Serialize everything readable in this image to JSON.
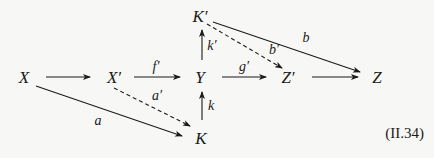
{
  "diagram": {
    "type": "commutative-diagram",
    "equation_number": "(II.34)",
    "nodes": [
      {
        "id": "X",
        "label": "X",
        "x": 24,
        "y": 77
      },
      {
        "id": "Xp",
        "label": "X′",
        "x": 113,
        "y": 77
      },
      {
        "id": "Y",
        "label": "Y",
        "x": 200,
        "y": 77
      },
      {
        "id": "Zp",
        "label": "Z′",
        "x": 286,
        "y": 77
      },
      {
        "id": "Z",
        "label": "Z",
        "x": 376,
        "y": 77
      },
      {
        "id": "Kp",
        "label": "K′",
        "x": 198,
        "y": 16
      },
      {
        "id": "K",
        "label": "K",
        "x": 200,
        "y": 137
      }
    ],
    "edges": [
      {
        "from": "X",
        "to": "Xp",
        "label": "",
        "style": "solid"
      },
      {
        "from": "Xp",
        "to": "Y",
        "label": "f′",
        "style": "solid"
      },
      {
        "from": "Y",
        "to": "Zp",
        "label": "g′",
        "style": "solid"
      },
      {
        "from": "Zp",
        "to": "Z",
        "label": "",
        "style": "solid"
      },
      {
        "from": "Y",
        "to": "Kp",
        "label": "k′",
        "style": "solid"
      },
      {
        "from": "K",
        "to": "Y",
        "label": "k",
        "style": "solid"
      },
      {
        "from": "Kp",
        "to": "Z",
        "label": "b",
        "style": "solid"
      },
      {
        "from": "Kp",
        "to": "Zp",
        "label": "b′",
        "style": "dashed"
      },
      {
        "from": "X",
        "to": "K",
        "label": "a",
        "style": "solid"
      },
      {
        "from": "Xp",
        "to": "K",
        "label": "a′",
        "style": "dashed"
      }
    ],
    "labels": {
      "X": "X",
      "Xp": "X′",
      "Y": "Y",
      "Zp": "Z′",
      "Z": "Z",
      "Kp": "K′",
      "K": "K",
      "f_prime": "f′",
      "g_prime": "g′",
      "k_prime": "k′",
      "k": "k",
      "b": "b",
      "b_prime": "b′",
      "a": "a",
      "a_prime": "a′"
    }
  }
}
